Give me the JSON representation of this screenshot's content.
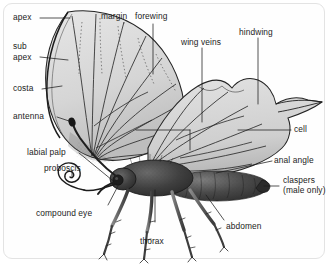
{
  "figure": {
    "style": "grayscale pen-and-ink illustration",
    "border_color": "#e3e3e3",
    "background_color": "#ffffff",
    "ink_color": "#1c1c1c",
    "wing_fill": "#d8d8d8",
    "body_fill": "#3a3a3a"
  },
  "labels": {
    "apex": "apex",
    "sub": "sub",
    "sub_apex": "apex",
    "costa": "costa",
    "antenna": "antenna",
    "labial_palp": "labial palp",
    "proboscis": "proboscis",
    "compound_eye": "compound eye",
    "margin": "margin",
    "forewing": "forewing",
    "wing_veins": "wing veins",
    "hindwing": "hindwing",
    "cell": "cell",
    "anal_angle": "anal angle",
    "claspers": "claspers",
    "claspers_note": "(male only)",
    "abdomen": "abdomen",
    "thorax": "thorax"
  }
}
